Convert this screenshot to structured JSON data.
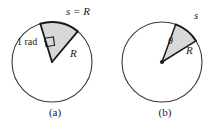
{
  "figure": {
    "background_color": "#ffffff",
    "width": 220,
    "height": 131
  },
  "style": {
    "circle_stroke": "#3a3a3a",
    "sector_fill": "#d8d8d8",
    "sector_stroke": "#1a1a1a",
    "text_color": "#1a1a1a",
    "center_dot_color": "#1a1a1a"
  },
  "panels": [
    {
      "id": "a",
      "caption": "(a)",
      "center": {
        "x": 52,
        "y": 62
      },
      "radius": 40,
      "sector": {
        "start_angle_deg": 107,
        "end_angle_deg": 50,
        "arc_label": "s = R",
        "radius_label": "R",
        "angle_label": "1 rad",
        "angle_marker": "square"
      }
    },
    {
      "id": "b",
      "caption": "(b)",
      "center": {
        "x": 52,
        "y": 62
      },
      "radius": 40,
      "sector": {
        "start_angle_deg": 70,
        "end_angle_deg": 32,
        "arc_label": "s",
        "radius_label": "R",
        "angle_label": "θ",
        "angle_marker": "none"
      }
    }
  ]
}
